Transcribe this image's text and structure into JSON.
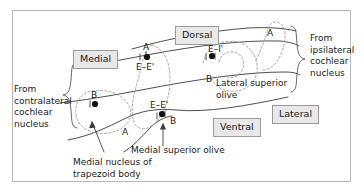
{
  "figure": {
    "frame_border_color": "#b9b9b9",
    "outline_color": "#3a3a3a",
    "nucleus_dash_color": "#9c9c9c",
    "label_box_fill": "#e8e8e8",
    "label_box_border": "#9a9a9a",
    "text_color": "#1a1a1a"
  },
  "orientation_labels": {
    "dorsal": "Dorsal",
    "ventral": "Ventral",
    "medial": "Medial",
    "lateral": "Lateral"
  },
  "inputs": {
    "contralateral": "From\ncontralateral\ncochlear\nnucleus",
    "ipsilateral": "From\nipsilateral\ncochlear\nnucleus"
  },
  "structures": {
    "lso": "Lateral superior\nolive",
    "mso": "Medial superior olive",
    "mntb": "Medial nucleus of\ntrapezoid body"
  },
  "markers": {
    "lso_response": "E–I'",
    "lso_region_b": "B",
    "lso_region_a": "A",
    "mso_upper_response": "E–E'",
    "mso_upper_a": "A",
    "mso_lower_response": "E–E'",
    "mso_lower_b": "B",
    "mntb_b": "B",
    "mntb_a": "A"
  }
}
